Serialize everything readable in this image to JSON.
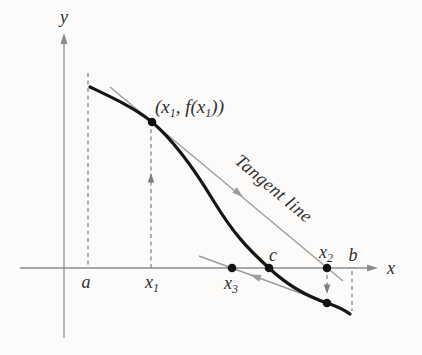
{
  "figure": {
    "labels": {
      "y_axis": "y",
      "x_axis": "x",
      "a": "a",
      "b": "b",
      "c": "c",
      "x1": {
        "base": "x",
        "sub": "1"
      },
      "x2": {
        "base": "x",
        "sub": "2"
      },
      "x3": {
        "base": "x",
        "sub": "3"
      },
      "point": {
        "open": "(x",
        "sub1": "1",
        "mid": ", f(x",
        "sub2": "1",
        "close": "))"
      },
      "tangent": "Tangent line"
    },
    "colors": {
      "background": "#fcfbf9",
      "curve": "#161616",
      "axis": "#8c8c8c",
      "tangent_line": "#9c9c9c",
      "dashed": "#7d7d7d",
      "dot": "#111111",
      "text": "#2e2e2e"
    }
  }
}
